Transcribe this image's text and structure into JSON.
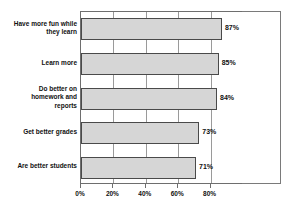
{
  "chart_data": {
    "type": "bar",
    "orientation": "horizontal",
    "title": "",
    "subtitle": "",
    "xlabel": "",
    "ylabel": "",
    "categories": [
      "Have more fun while they learn",
      "Learn more",
      "Do better on homework and reports",
      "Get better grades",
      "Are better students"
    ],
    "category_lines": [
      [
        "Have more fun while",
        "they learn"
      ],
      [
        "Learn more"
      ],
      [
        "Do better on",
        "homework and",
        "reports"
      ],
      [
        "Get better grades"
      ],
      [
        "Are better students"
      ]
    ],
    "values": [
      87,
      85,
      84,
      73,
      71
    ],
    "value_labels": [
      "87%",
      "85%",
      "84%",
      "73%",
      "71%"
    ],
    "xlim": [
      0,
      100
    ],
    "xticks": [
      0,
      20,
      40,
      60,
      80
    ],
    "xtick_labels": [
      "0%",
      "20%",
      "40%",
      "60%",
      "80%"
    ],
    "grid": true,
    "legend": null,
    "bar_fill_color": "#d6d6d6",
    "bar_border_color": "#4a4a4a",
    "axis_color": "#6e6e6e",
    "text_color": "#111111",
    "background_color": "#ffffff"
  }
}
